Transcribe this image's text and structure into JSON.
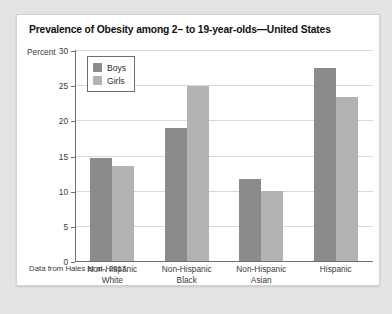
{
  "card": {
    "title": "Prevalence of Obesity among 2– to 19-year-olds—United States",
    "source_note": "Data from Hales et al., 2017."
  },
  "chart_data": {
    "type": "bar",
    "title": "Prevalence of Obesity among 2– to 19-year-olds—United States",
    "xlabel": "",
    "ylabel": "Percent",
    "ylim": [
      0,
      30
    ],
    "yticks": [
      0,
      5,
      10,
      15,
      20,
      25,
      30
    ],
    "grid": true,
    "legend_position": "upper-left-inside",
    "categories": [
      "Non-Hispanic White",
      "Non-Hispanic Black",
      "Non-Hispanic Asian",
      "Hispanic"
    ],
    "category_lines": [
      [
        "Non-Hispanic",
        "White"
      ],
      [
        "Non-Hispanic",
        "Black"
      ],
      [
        "Non-Hispanic",
        "Asian"
      ],
      [
        "Hispanic",
        ""
      ]
    ],
    "series": [
      {
        "name": "Boys",
        "color": "#8b8b8b",
        "values": [
          14.7,
          18.9,
          11.7,
          27.5
        ]
      },
      {
        "name": "Girls",
        "color": "#b3b3b3",
        "values": [
          13.5,
          24.9,
          10.0,
          23.3
        ]
      }
    ]
  }
}
